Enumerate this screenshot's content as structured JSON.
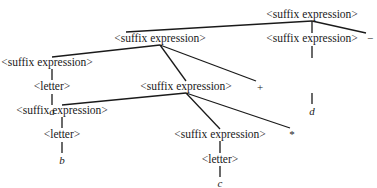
{
  "diagram": {
    "type": "parse-tree",
    "nodes": {
      "root": "<suffix expression>",
      "l1_left": "<suffix expression>",
      "l1_right": "<suffix expression>",
      "l1_op": "−",
      "l2_left": "<suffix expression>",
      "l2_mid": "<suffix expression>",
      "l2_op": "+",
      "letter_a": "<letter>",
      "a": "a",
      "l3_left": "<suffix expression>",
      "l3_right": "<suffix expression>",
      "l3_op": "*",
      "letter_b": "<letter>",
      "b": "b",
      "letter_c": "<letter>",
      "c": "c",
      "d": "d"
    }
  }
}
